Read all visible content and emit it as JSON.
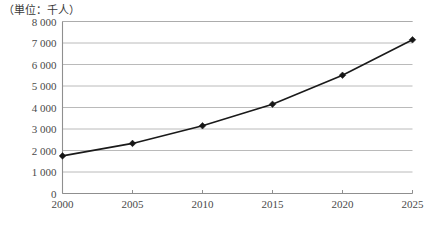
{
  "unit_note": "（単位：千人）",
  "chart_data": {
    "type": "line",
    "title": "",
    "subtitle": "",
    "xlabel": "",
    "ylabel": "",
    "unit_label": "（単位：千人）",
    "categories": [
      "2000",
      "2005",
      "2010",
      "2015",
      "2020",
      "2025"
    ],
    "x": [
      2000,
      2005,
      2010,
      2015,
      2020,
      2025
    ],
    "values": [
      1750,
      2330,
      3150,
      4150,
      5500,
      7150
    ],
    "series": [
      {
        "name": "",
        "values": [
          1750,
          2330,
          3150,
          4150,
          5500,
          7150
        ],
        "color": "#161616",
        "marker": "diamond"
      }
    ],
    "ylim": [
      0,
      8000
    ],
    "xlim": [
      2000,
      2025
    ],
    "ytick_labels": [
      "0",
      "1 000",
      "2 000",
      "3 000",
      "4 000",
      "5 000",
      "6 000",
      "7 000",
      "8 000"
    ],
    "ytick_values": [
      0,
      1000,
      2000,
      3000,
      4000,
      5000,
      6000,
      7000,
      8000
    ],
    "xtick_labels": [
      "2000",
      "2005",
      "2010",
      "2015",
      "2020",
      "2025"
    ],
    "grid": "horizontal",
    "legend": "none",
    "annotations": []
  },
  "colors": {
    "line": "#161616",
    "grid": "#a8a8a8",
    "axis": "#8f8f8f",
    "text": "#4a4a4a",
    "background": "#ffffff"
  }
}
